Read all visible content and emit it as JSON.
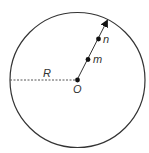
{
  "diagram": {
    "type": "geometry",
    "labels": {
      "radius": "R",
      "center": "O",
      "point_m": "m",
      "point_n": "n"
    },
    "colors": {
      "stroke": "#333333",
      "dashed": "#555555",
      "point": "#111111",
      "background": "#ffffff"
    }
  }
}
